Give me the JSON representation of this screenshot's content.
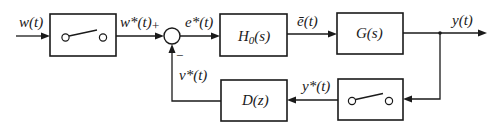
{
  "diagram": {
    "type": "sampled-data feedback control block diagram",
    "signals": {
      "input": "w(t)",
      "sampled_input": "w*(t)",
      "error_sampled": "e*(t)",
      "hold_output": "ē(t)",
      "output": "y(t)",
      "sampled_output": "y*(t)",
      "feedback": "v*(t)"
    },
    "blocks": {
      "sampler_forward": "sampler-switch",
      "zero_order_hold": "H0(s)",
      "zero_order_hold_main": "H",
      "zero_order_hold_sub": "0",
      "zero_order_hold_arg": "(s)",
      "plant": "G(s)",
      "controller": "D(z)",
      "sampler_feedback": "sampler-switch"
    },
    "summing_junction": {
      "plus_sign": "+",
      "minus_sign": "−"
    },
    "colors": {
      "line": "#1a1a1a",
      "background": "#ffffff"
    }
  }
}
